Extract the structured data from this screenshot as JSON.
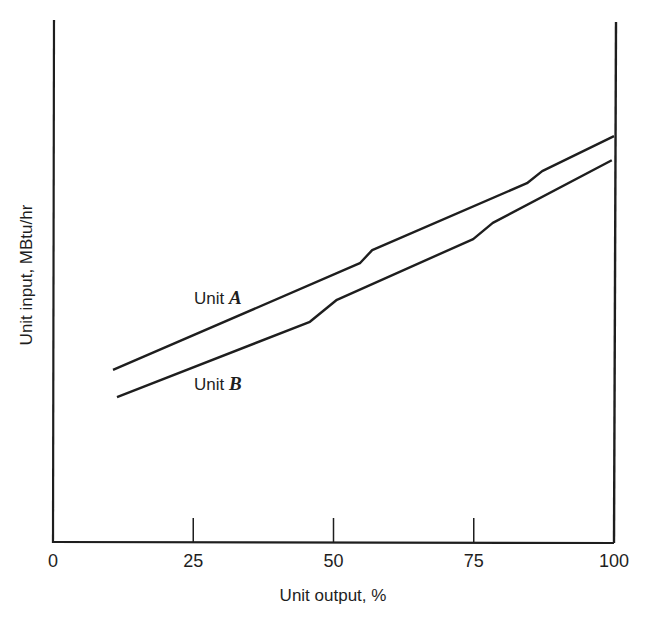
{
  "chart_data": {
    "type": "line",
    "title": "",
    "xlabel": "Unit output, %",
    "ylabel": "Unit input, MBtu/hr",
    "xlim": [
      0,
      100
    ],
    "ylim": [
      0,
      100
    ],
    "y_scale_note": "no y tick labels shown; y values are relative (0 = x-axis, 100 = top of axes)",
    "x_ticks": [
      0,
      25,
      50,
      75,
      100
    ],
    "x_tick_labels": [
      "0",
      "25",
      "50",
      "75",
      "100"
    ],
    "grid": false,
    "legend": "inline labels",
    "series": [
      {
        "name": "Unit A",
        "label_prefix": "Unit ",
        "label_letter": "A",
        "x": [
          10.7,
          54.7,
          56.9,
          84.5,
          87.2,
          100
        ],
        "y": [
          33.1,
          53.5,
          56.0,
          68.8,
          71.1,
          77.8
        ]
      },
      {
        "name": "Unit B",
        "label_prefix": "Unit ",
        "label_letter": "B",
        "x": [
          11.4,
          45.8,
          50.6,
          74.9,
          78.4,
          99.6
        ],
        "y": [
          27.9,
          42.3,
          46.5,
          58.1,
          61.2,
          73.2
        ]
      }
    ]
  },
  "colors": {
    "line": "#1e1e1e",
    "background": "#ffffff"
  }
}
